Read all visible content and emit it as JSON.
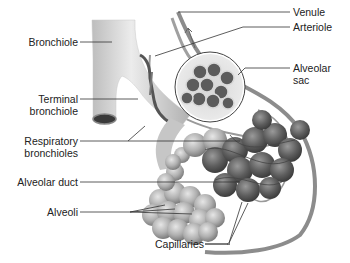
{
  "diagram": {
    "labels_left": [
      {
        "id": "bronchiole",
        "text": "Bronchiole"
      },
      {
        "id": "terminal-bronchiole",
        "line1": "Terminal",
        "line2": "bronchiole"
      },
      {
        "id": "respiratory-bronchioles",
        "line1": "Respiratory",
        "line2": "bronchioles"
      },
      {
        "id": "alveolar-duct",
        "text": "Alveolar duct"
      },
      {
        "id": "alveoli",
        "text": "Alveoli"
      }
    ],
    "labels_right": [
      {
        "id": "venule",
        "text": "Venule"
      },
      {
        "id": "arteriole",
        "text": "Arteriole"
      },
      {
        "id": "alveolar-sac",
        "line1": "Alveolar",
        "line2": "sac"
      }
    ],
    "labels_bottom": [
      {
        "id": "capillaries",
        "text": "Capillaries"
      }
    ],
    "colors": {
      "background": "#ffffff",
      "airway": "#d9d9d9",
      "airway_shade": "#a8a8a8",
      "alveoli": "#b5b5b5",
      "alveoli_dark": "#7a7a7a",
      "vessel": "#8c8c8c",
      "leader_line": "#333333",
      "text": "#222222"
    }
  }
}
